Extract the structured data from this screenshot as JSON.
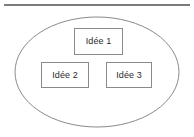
{
  "diagram": {
    "title": "",
    "top_rule": {
      "name": "horizontal-rule",
      "color": "#7b7b7b"
    },
    "container": {
      "shape": "ellipse",
      "label": "",
      "stroke": "#8a8a8a",
      "fill": "#ffffff",
      "cx": 97,
      "cy": 72,
      "rx": 82,
      "ry": 55
    },
    "nodes": [
      {
        "id": "idee-1",
        "label": "Idée 1",
        "x": 74,
        "y": 28,
        "w": 49,
        "h": 27
      },
      {
        "id": "idee-2",
        "label": "Idée 2",
        "x": 41,
        "y": 62,
        "w": 48,
        "h": 26
      },
      {
        "id": "idee-3",
        "label": "Idée 3",
        "x": 106,
        "y": 62,
        "w": 46,
        "h": 26
      }
    ],
    "colors": {
      "node_border": "#8a8a8a",
      "node_fill": "#ffffff",
      "text": "#2b2b2b",
      "background": "#ffffff"
    }
  }
}
